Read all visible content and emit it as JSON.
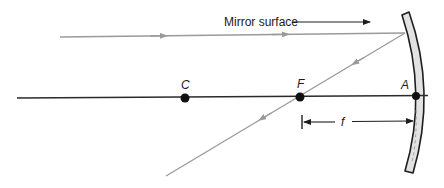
{
  "diagram": {
    "type": "concave-mirror-ray-diagram",
    "colors": {
      "axis": "#2a2a2a",
      "ray": "#9a9a9a",
      "mirror_fill": "#e2e2e2",
      "mirror_stroke": "#1e1e1e",
      "point": "#111111",
      "label": "#1a1a1a"
    },
    "labels": {
      "mirror_surface": "Mirror surface",
      "center_of_curvature": "C",
      "focal_point": "F",
      "vertex": "A",
      "focal_length": "f"
    },
    "points": {
      "C": {
        "x": 185,
        "y": 98
      },
      "F": {
        "x": 300,
        "y": 97
      },
      "A": {
        "x": 416,
        "y": 96
      }
    },
    "rays": [
      {
        "name": "incident-ray",
        "from": [
          60,
          37
        ],
        "to": [
          405,
          33
        ],
        "arrows": 2
      },
      {
        "name": "reflected-ray",
        "from": [
          405,
          33
        ],
        "via": [
          300,
          97
        ],
        "to": [
          166,
          176
        ],
        "arrows": 2
      }
    ]
  }
}
